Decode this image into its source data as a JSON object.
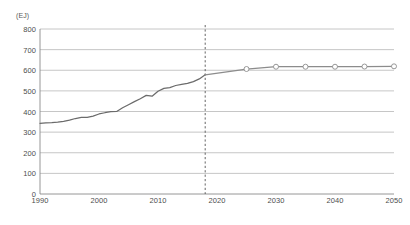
{
  "chart_data": {
    "type": "line",
    "title": "",
    "subtitle": "",
    "xlabel": "",
    "ylabel": "",
    "unit_label": "(EJ)",
    "xlim": [
      1990,
      2050
    ],
    "ylim": [
      0,
      800
    ],
    "ytick_step": 100,
    "xtick_step": 10,
    "grid": "horizontal",
    "legend": "none",
    "yticks": [
      "800",
      "700",
      "600",
      "500",
      "400",
      "300",
      "200",
      "100",
      "0"
    ],
    "xticks": [
      "1990",
      "2000",
      "2010",
      "2020",
      "2030",
      "2040",
      "2050"
    ],
    "annotations": [
      {
        "name": "forecast-divider",
        "type": "vertical-dashed-line",
        "x": 2018
      }
    ],
    "series": [
      {
        "name": "historical",
        "style": "solid-line",
        "markers": false,
        "color": "#6b6b6b",
        "x": [
          1990,
          1991,
          1992,
          1993,
          1994,
          1995,
          1996,
          1997,
          1998,
          1999,
          2000,
          2001,
          2002,
          2003,
          2004,
          2005,
          2006,
          2007,
          2008,
          2009,
          2010,
          2011,
          2012,
          2013,
          2014,
          2015,
          2016,
          2017,
          2018
        ],
        "values": [
          343,
          345,
          346,
          348,
          352,
          358,
          366,
          371,
          372,
          378,
          388,
          394,
          399,
          400,
          418,
          433,
          448,
          462,
          478,
          474,
          498,
          512,
          516,
          526,
          532,
          536,
          545,
          558,
          578
        ]
      },
      {
        "name": "projection",
        "style": "solid-line",
        "markers": true,
        "marker_shape": "open-circle",
        "color": "#8c8c8c",
        "x": [
          2018,
          2025,
          2030,
          2035,
          2040,
          2045,
          2050
        ],
        "values": [
          578,
          606,
          617,
          617,
          617,
          618,
          619
        ]
      }
    ]
  }
}
